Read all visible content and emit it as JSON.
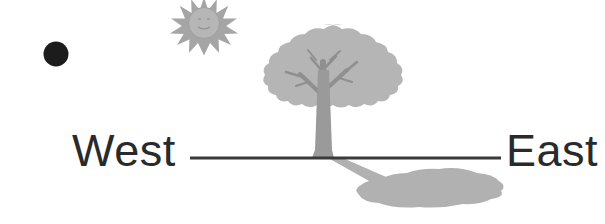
{
  "diagram": {
    "background_color": "#ffffff",
    "ground_line": {
      "label": "ground-line",
      "color": "#3a3a3a",
      "x_start": 190,
      "x_end": 501,
      "y": 158,
      "thickness": 3
    },
    "labels": {
      "west": "West",
      "east": "East",
      "text_color": "#2a2a2a"
    },
    "sun": {
      "name": "sun-icon",
      "fill": "#a9a9a9",
      "core_fill": "#b4b4b4",
      "face_stroke": "#8e8e8e",
      "center_x": 204,
      "center_y": 23,
      "core_radius": 15,
      "ray_radius": 24,
      "ray_count": 14,
      "has_face": true
    },
    "dot": {
      "name": "dark-dot",
      "fill": "#1c1c1c",
      "center_x": 56,
      "center_y": 54,
      "radius": 12
    },
    "tree": {
      "name": "tree",
      "canopy_fill": "#b5b5b5",
      "branch_fill": "#8f8f8f",
      "trunk_fill": "#9a9a9a",
      "canopy_center_x": 323,
      "canopy_center_y": 81,
      "canopy_radius_x": 68,
      "canopy_radius_y": 54,
      "trunk_top_y": 60,
      "trunk_base_y": 158,
      "trunk_base_width": 17
    },
    "shadow": {
      "name": "tree-shadow",
      "fill": "#b0b0b0",
      "direction": "east",
      "blob_center_x": 436,
      "blob_center_y": 192,
      "blob_radius_x": 66,
      "blob_radius_y": 19,
      "stem_start_x": 333,
      "stem_end_x": 392
    }
  }
}
